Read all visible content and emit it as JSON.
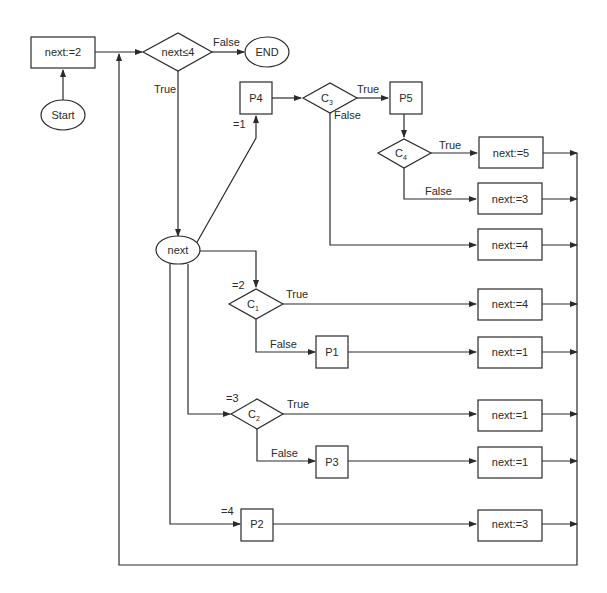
{
  "diagram": {
    "type": "flowchart",
    "nodes": {
      "init": {
        "label": "next:=2"
      },
      "start": {
        "label": "Start"
      },
      "cond_main": {
        "label": "next≤4"
      },
      "end": {
        "label": "END"
      },
      "next_switch": {
        "label": "next"
      },
      "p4": {
        "label": "P4"
      },
      "c3": {
        "label": "C",
        "sub": "3"
      },
      "p5": {
        "label": "P5"
      },
      "c4": {
        "label": "C",
        "sub": "4"
      },
      "set5": {
        "label": "next:=5"
      },
      "set3a": {
        "label": "next:=3"
      },
      "set4a": {
        "label": "next:=4"
      },
      "c1": {
        "label": "C",
        "sub": "1"
      },
      "set4b": {
        "label": "next:=4"
      },
      "p1": {
        "label": "P1"
      },
      "set1a": {
        "label": "next:=1"
      },
      "c2": {
        "label": "C",
        "sub": "2"
      },
      "set1b": {
        "label": "next:=1"
      },
      "p3": {
        "label": "P3"
      },
      "set1c": {
        "label": "next:=1"
      },
      "p2": {
        "label": "P2"
      },
      "set3b": {
        "label": "next:=3"
      }
    },
    "edge_labels": {
      "main_false": "False",
      "main_true": "True",
      "case1": "=1",
      "case2": "=2",
      "case3": "=3",
      "case4": "=4",
      "c3_true": "True",
      "c3_false": "False",
      "c4_true": "True",
      "c4_false": "False",
      "c1_true": "True",
      "c1_false": "False",
      "c2_true": "True",
      "c2_false": "False"
    }
  }
}
